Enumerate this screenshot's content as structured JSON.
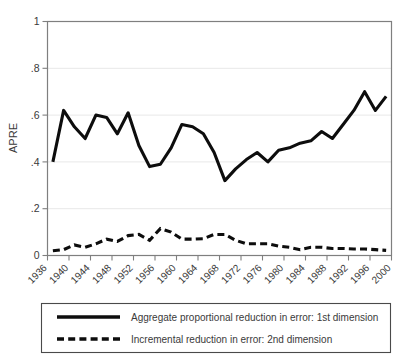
{
  "chart_data": {
    "type": "line",
    "title": "",
    "xlabel": "",
    "ylabel": "APRE",
    "xlim": [
      1936,
      2000
    ],
    "ylim": [
      0,
      1
    ],
    "yticks": [
      0,
      0.2,
      0.4,
      0.6,
      0.8,
      1
    ],
    "ytick_labels": [
      "0",
      ".2",
      ".4",
      ".6",
      ".8",
      "1"
    ],
    "xticks": [
      1936,
      1940,
      1944,
      1948,
      1952,
      1956,
      1960,
      1964,
      1968,
      1972,
      1976,
      1980,
      1984,
      1988,
      1992,
      1996,
      2000
    ],
    "xtick_labels": [
      "1936",
      "1940",
      "1944",
      "1948",
      "1952",
      "1956",
      "1960",
      "1964",
      "1968",
      "1972",
      "1976",
      "1980",
      "1984",
      "1988",
      "1992",
      "1996",
      "2000"
    ],
    "grid": "horizontal",
    "legend_position": "below-plot",
    "x": [
      1937,
      1939,
      1941,
      1943,
      1945,
      1947,
      1949,
      1951,
      1953,
      1955,
      1957,
      1959,
      1961,
      1963,
      1965,
      1967,
      1969,
      1971,
      1973,
      1975,
      1977,
      1979,
      1981,
      1983,
      1985,
      1987,
      1989,
      1991,
      1993,
      1995,
      1997,
      1999
    ],
    "series": [
      {
        "name": "Aggregate proportional reduction in error: 1st dimension",
        "style": "solid",
        "color": "#0d0d0d",
        "values": [
          0.4,
          0.62,
          0.55,
          0.5,
          0.6,
          0.59,
          0.52,
          0.61,
          0.47,
          0.38,
          0.39,
          0.46,
          0.56,
          0.55,
          0.52,
          0.44,
          0.32,
          0.37,
          0.41,
          0.44,
          0.4,
          0.45,
          0.46,
          0.48,
          0.49,
          0.53,
          0.5,
          0.56,
          0.62,
          0.7,
          0.62,
          0.68
        ]
      },
      {
        "name": "Incremental reduction in error: 2nd dimension",
        "style": "dashed",
        "color": "#0d0d0d",
        "values": [
          0.02,
          0.025,
          0.045,
          0.035,
          0.05,
          0.07,
          0.06,
          0.085,
          0.09,
          0.065,
          0.115,
          0.1,
          0.07,
          0.07,
          0.072,
          0.09,
          0.09,
          0.065,
          0.05,
          0.05,
          0.05,
          0.04,
          0.035,
          0.025,
          0.035,
          0.035,
          0.03,
          0.03,
          0.028,
          0.028,
          0.025,
          0.022
        ]
      }
    ]
  },
  "legend": {
    "entries": [
      {
        "label": "Aggregate proportional reduction in error: 1st dimension",
        "style": "solid"
      },
      {
        "label": "Incremental reduction in error: 2nd dimension",
        "style": "dashed"
      }
    ]
  }
}
